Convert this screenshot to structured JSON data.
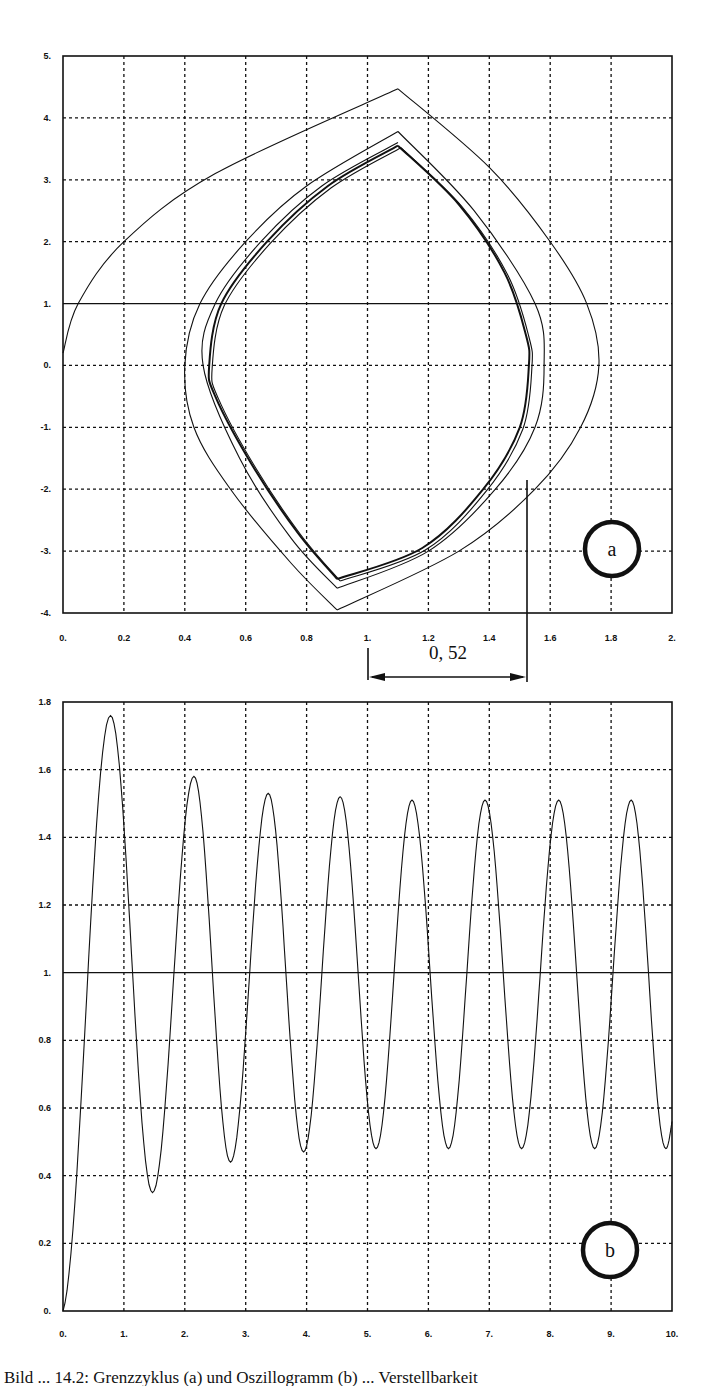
{
  "figure": {
    "caption": "Bild ... 14.2: Grenzzyklus (a) und Oszillogramm (b) ... Verstellbarkeit"
  },
  "chart_data": [
    {
      "id": "a",
      "type": "line",
      "title": "",
      "panel_label": "a",
      "xlabel": "",
      "ylabel": "",
      "xlim": [
        0,
        2
      ],
      "ylim": [
        -4,
        5
      ],
      "grid": true,
      "x_ticks": [
        "0.",
        "0.2",
        "0.4",
        "0.6",
        "0.8",
        "1.",
        "1.2",
        "1.4",
        "1.6",
        "1.8",
        "2."
      ],
      "y_ticks": [
        "5.",
        "4.",
        "3.",
        "2.",
        "1.",
        "0.",
        "-1.",
        "-2.",
        "-3.",
        "-4."
      ],
      "reference_line": {
        "orientation": "horizontal",
        "y": 1.0
      },
      "marker_line": {
        "orientation": "vertical",
        "x": 1.52
      },
      "annotation": {
        "text": "0, 52",
        "from_x": 1.0,
        "to_x": 1.52
      },
      "series": [
        {
          "name": "trajectory-outer",
          "description": "starts near (0, 0.2), spirals inward",
          "points": [
            [
              0.0,
              0.2
            ],
            [
              0.05,
              1.0
            ],
            [
              0.2,
              2.0
            ],
            [
              0.5,
              3.1
            ],
            [
              1.1,
              4.47
            ],
            [
              1.4,
              3.2
            ],
            [
              1.6,
              2.0
            ],
            [
              1.72,
              1.0
            ],
            [
              1.76,
              0.0
            ],
            [
              1.7,
              -1.0
            ],
            [
              1.55,
              -2.0
            ],
            [
              1.3,
              -3.0
            ],
            [
              0.9,
              -3.95
            ],
            [
              0.75,
              -3.2
            ],
            [
              0.55,
              -2.0
            ],
            [
              0.43,
              -1.0
            ],
            [
              0.4,
              0.0
            ],
            [
              0.45,
              1.0
            ],
            [
              0.6,
              2.0
            ],
            [
              0.8,
              2.9
            ],
            [
              1.1,
              3.78
            ]
          ]
        },
        {
          "name": "limit-cycle-2",
          "points": [
            [
              1.1,
              3.78
            ],
            [
              1.35,
              2.5
            ],
            [
              1.55,
              1.0
            ],
            [
              1.58,
              0.0
            ],
            [
              1.55,
              -1.0
            ],
            [
              1.42,
              -2.0
            ],
            [
              1.2,
              -3.0
            ],
            [
              0.9,
              -3.6
            ],
            [
              0.75,
              -2.8
            ],
            [
              0.58,
              -1.5
            ],
            [
              0.46,
              0.0
            ],
            [
              0.5,
              1.0
            ],
            [
              0.65,
              2.0
            ],
            [
              0.85,
              2.9
            ],
            [
              1.1,
              3.6
            ]
          ]
        },
        {
          "name": "limit-cycle",
          "description": "converged closed orbit",
          "points": [
            [
              1.1,
              3.55
            ],
            [
              1.3,
              2.6
            ],
            [
              1.45,
              1.5
            ],
            [
              1.52,
              0.5
            ],
            [
              1.53,
              0.0
            ],
            [
              1.5,
              -1.0
            ],
            [
              1.38,
              -2.0
            ],
            [
              1.18,
              -2.95
            ],
            [
              0.9,
              -3.45
            ],
            [
              0.77,
              -2.7
            ],
            [
              0.62,
              -1.6
            ],
            [
              0.5,
              -0.5
            ],
            [
              0.48,
              0.0
            ],
            [
              0.52,
              1.0
            ],
            [
              0.67,
              2.0
            ],
            [
              0.87,
              2.9
            ],
            [
              1.1,
              3.55
            ]
          ]
        }
      ]
    },
    {
      "id": "b",
      "type": "line",
      "title": "",
      "panel_label": "b",
      "xlabel": "",
      "ylabel": "",
      "xlim": [
        0,
        10
      ],
      "ylim": [
        0,
        1.8
      ],
      "grid": true,
      "x_ticks": [
        "0.",
        "1.",
        "2.",
        "3.",
        "4.",
        "5.",
        "6.",
        "7.",
        "8.",
        "9.",
        "10."
      ],
      "y_ticks": [
        "1.8",
        "1.6",
        "1.4",
        "1.2",
        "1.",
        "0.8",
        "0.6",
        "0.4",
        "0.2",
        "0."
      ],
      "reference_line": {
        "orientation": "horizontal",
        "y": 1.0
      },
      "peaks": [
        {
          "x": 0.78,
          "y": 1.76
        },
        {
          "x": 2.15,
          "y": 1.58
        },
        {
          "x": 3.37,
          "y": 1.53
        },
        {
          "x": 4.55,
          "y": 1.52
        },
        {
          "x": 5.73,
          "y": 1.51
        },
        {
          "x": 6.93,
          "y": 1.51
        },
        {
          "x": 8.14,
          "y": 1.51
        },
        {
          "x": 9.33,
          "y": 1.51
        }
      ],
      "troughs": [
        {
          "x": 1.47,
          "y": 0.35
        },
        {
          "x": 2.75,
          "y": 0.44
        },
        {
          "x": 3.95,
          "y": 0.47
        },
        {
          "x": 5.14,
          "y": 0.48
        },
        {
          "x": 6.33,
          "y": 0.48
        },
        {
          "x": 7.53,
          "y": 0.48
        },
        {
          "x": 8.73,
          "y": 0.48
        },
        {
          "x": 9.9,
          "y": 0.48
        }
      ],
      "start": {
        "x": 0.0,
        "y": 0.0
      },
      "end": {
        "x": 10.0,
        "y": 0.56
      }
    }
  ]
}
